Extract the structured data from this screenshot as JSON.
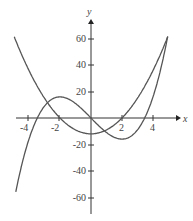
{
  "chart_data": {
    "type": "line",
    "title": "",
    "xlabel": "x",
    "ylabel": "y",
    "xlim": [
      -5,
      5
    ],
    "ylim": [
      -70,
      70
    ],
    "x_ticks": [
      "-4",
      "-2",
      "2",
      "4"
    ],
    "y_ticks": [
      "60",
      "40",
      "20",
      "-20",
      "-40",
      "-60"
    ],
    "grid": false,
    "legend": null,
    "series": [
      {
        "name": "cubic",
        "expr": "x^3 - 12x",
        "x": [
          -4.1,
          -3,
          -2,
          -1,
          0,
          1,
          2,
          3,
          4,
          5
        ],
        "values": [
          -19.7,
          9,
          16,
          11,
          0,
          -11,
          -16,
          -9,
          16,
          65
        ]
      },
      {
        "name": "parabola",
        "expr": "3x^2 - 12",
        "x": [
          -5,
          -4,
          -3,
          -2,
          -1,
          0,
          1,
          2,
          3,
          4,
          5
        ],
        "values": [
          63,
          36,
          15,
          0,
          -9,
          -12,
          -9,
          0,
          15,
          36,
          63
        ]
      }
    ],
    "color": "#555555"
  }
}
